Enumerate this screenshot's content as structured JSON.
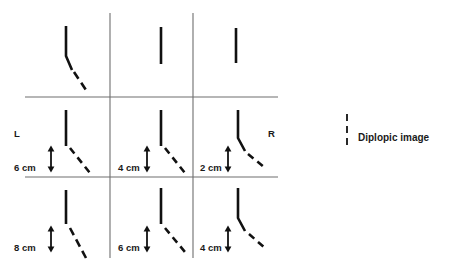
{
  "figure": {
    "type": "diplopia-field-chart",
    "title": "",
    "side_labels": {
      "left": "L",
      "right": "R"
    },
    "legend": {
      "symbol": "dashed-vertical-line",
      "label": "Diplopic image"
    },
    "grid": {
      "columns": 3,
      "rows": 3,
      "vertical_lines_x": [
        110,
        193
      ],
      "horizontal_lines_y": [
        97,
        177
      ],
      "line_color": "#6e6e6e"
    },
    "colors": {
      "line": "#111111",
      "grid": "#6e6e6e",
      "text": "#1a1a1a",
      "background": "#ffffff"
    },
    "cells": [
      {
        "id": "r1c1",
        "row": 1,
        "col": 1,
        "gaze": "up-left",
        "separation_label": "",
        "has_diplopic_image": true,
        "has_arrow": false,
        "bent": true
      },
      {
        "id": "r1c2",
        "row": 1,
        "col": 2,
        "gaze": "up-center",
        "separation_label": "",
        "has_diplopic_image": false,
        "has_arrow": false,
        "bent": false
      },
      {
        "id": "r1c3",
        "row": 1,
        "col": 3,
        "gaze": "up-right",
        "separation_label": "",
        "has_diplopic_image": false,
        "has_arrow": false,
        "bent": false
      },
      {
        "id": "r2c1",
        "row": 2,
        "col": 1,
        "gaze": "left",
        "separation_label": "6 cm",
        "separation_value": 6,
        "separation_unit": "cm",
        "has_diplopic_image": true,
        "has_arrow": true,
        "bent": false
      },
      {
        "id": "r2c2",
        "row": 2,
        "col": 2,
        "gaze": "primary",
        "separation_label": "4 cm",
        "separation_value": 4,
        "separation_unit": "cm",
        "has_diplopic_image": true,
        "has_arrow": true,
        "bent": false
      },
      {
        "id": "r2c3",
        "row": 2,
        "col": 3,
        "gaze": "right",
        "separation_label": "2 cm",
        "separation_value": 2,
        "separation_unit": "cm",
        "has_diplopic_image": true,
        "has_arrow": true,
        "bent": true
      },
      {
        "id": "r3c1",
        "row": 3,
        "col": 1,
        "gaze": "down-left",
        "separation_label": "8 cm",
        "separation_value": 8,
        "separation_unit": "cm",
        "has_diplopic_image": true,
        "has_arrow": true,
        "bent": false
      },
      {
        "id": "r3c2",
        "row": 3,
        "col": 2,
        "gaze": "down-center",
        "separation_label": "6 cm",
        "separation_value": 6,
        "separation_unit": "cm",
        "has_diplopic_image": true,
        "has_arrow": true,
        "bent": false
      },
      {
        "id": "r3c3",
        "row": 3,
        "col": 3,
        "gaze": "down-right",
        "separation_label": "4 cm",
        "separation_value": 4,
        "separation_unit": "cm",
        "has_diplopic_image": true,
        "has_arrow": true,
        "bent": true
      }
    ]
  }
}
